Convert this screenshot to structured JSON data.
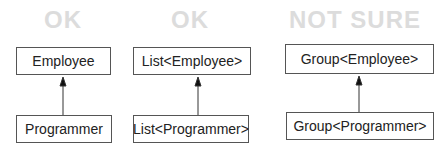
{
  "columns": [
    {
      "heading": "OK",
      "supertype": "Employee",
      "subtype": "Programmer"
    },
    {
      "heading": "OK",
      "supertype": "List<Employee>",
      "subtype": "List<Programmer>"
    },
    {
      "heading": "NOT SURE",
      "supertype": "Group<Employee>",
      "subtype": "Group<Programmer>"
    }
  ],
  "colors": {
    "heading": "#dcdcdc",
    "border": "#555555",
    "text": "#222222"
  }
}
